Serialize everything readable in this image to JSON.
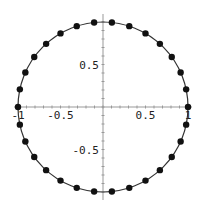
{
  "chart_data": {
    "type": "scatter",
    "title": "",
    "xlabel": "",
    "ylabel": "",
    "xlim": [
      -1,
      1
    ],
    "ylim": [
      -1,
      1
    ],
    "grid": false,
    "num_points": 30,
    "angle_step_deg": 12,
    "x_ticks": [
      "-1",
      "-0.5",
      "0.5",
      "1"
    ],
    "y_ticks": [
      "0.5",
      "-0.5"
    ],
    "curve": "x^2 + y^2 = 1",
    "colors": {
      "points": "#111111",
      "curve": "#333333",
      "axes": "#888888"
    }
  }
}
